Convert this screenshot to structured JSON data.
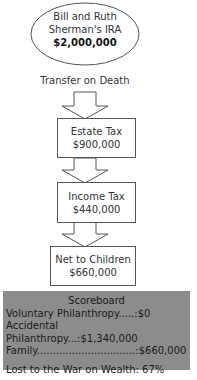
{
  "ira": {
    "line1": "Bill and Ruth",
    "line2": "Sherman's IRA",
    "amount": "$2,000,000"
  },
  "transfer_label": "Transfer on Death",
  "steps": [
    {
      "label": "Estate Tax",
      "amount": "$900,000"
    },
    {
      "label": "Income Tax",
      "amount": "$440,000"
    },
    {
      "label": "Net to Children",
      "amount": "$660,000"
    }
  ],
  "scoreboard": {
    "title": "Scoreboard",
    "rows": [
      {
        "text": "Voluntary Philanthropy.....:$0"
      },
      {
        "text": "Accidental Philanthropy...:$1,340,000"
      },
      {
        "text": "Family...............................:$660,000"
      }
    ],
    "lost": "Lost to the War on Wealth: 67%"
  },
  "colors": {
    "scoreboard_bg": "#8c8c8c",
    "stroke": "#555555"
  }
}
